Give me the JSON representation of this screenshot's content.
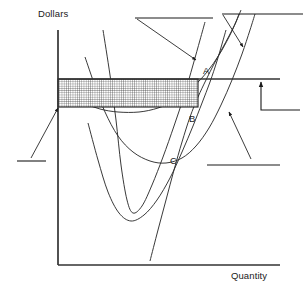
{
  "figure": {
    "kind": "economics-cost-curve-diagram",
    "axes": {
      "y_label": "Dollars",
      "x_label": "Quantity",
      "origin": [
        58,
        265
      ],
      "y_top": [
        58,
        30
      ],
      "x_right": [
        280,
        265
      ],
      "line_color": "#333333"
    },
    "point_labels": [
      {
        "name": "A",
        "text": "A",
        "x": 203,
        "y": 65
      },
      {
        "name": "B",
        "text": "B",
        "x": 189,
        "y": 113
      },
      {
        "name": "C",
        "text": "C",
        "x": 170,
        "y": 155
      }
    ],
    "price_line": {
      "label": "",
      "y": 79,
      "x_start": 58,
      "x_end": 280,
      "color": "#333333"
    },
    "shaded_region": {
      "label": "",
      "x": 58,
      "y": 79,
      "width": 140,
      "height": 28,
      "fill": "cross-hatch",
      "hatch_spacing": 2.2,
      "hatch_color": "#2b2b2b",
      "border_color": "#1a1a1a"
    },
    "callouts": [
      {
        "name": "callout-top-left",
        "text": "",
        "line": {
          "x1": 135,
          "y1": 18,
          "x2": 213,
          "y2": 18
        },
        "leader": {
          "x1": 137,
          "y1": 19,
          "x2": 196,
          "y2": 60
        },
        "arrow": true
      },
      {
        "name": "callout-top-right",
        "text": "",
        "line": {
          "x1": 222,
          "y1": 14,
          "x2": 303,
          "y2": 14
        },
        "leader": {
          "x1": 223,
          "y1": 15,
          "x2": 243,
          "y2": 47
        },
        "arrow": true
      },
      {
        "name": "callout-left",
        "text": "",
        "line": {
          "x1": 17,
          "y1": 161,
          "x2": 46,
          "y2": 161
        },
        "leader": {
          "x1": 31,
          "y1": 158,
          "x2": 58,
          "y2": 108
        },
        "arrow": true
      },
      {
        "name": "callout-bottom-right",
        "text": "",
        "line": {
          "x1": 207,
          "y1": 165,
          "x2": 280,
          "y2": 165
        },
        "leader": {
          "x1": 251,
          "y1": 159,
          "x2": 229,
          "y2": 112
        },
        "arrow": true
      },
      {
        "name": "callout-price-elbow",
        "text": "",
        "elbow": {
          "x": 261,
          "y_bottom": 110,
          "y_top": 82,
          "x_end": 300
        },
        "arrow": true
      }
    ],
    "curves": [
      {
        "name": "marginal-cost-curve",
        "role": "MC",
        "label": "",
        "color": "#2e2e2e",
        "points": [
          [
            103,
            30
          ],
          [
            110,
            75
          ],
          [
            116,
            120
          ],
          [
            121,
            165
          ],
          [
            127,
            200
          ],
          [
            133,
            213
          ],
          [
            142,
            206
          ],
          [
            152,
            185
          ],
          [
            163,
            157
          ],
          [
            174,
            126
          ],
          [
            184,
            96
          ],
          [
            193,
            65
          ],
          [
            200,
            40
          ],
          [
            205,
            22
          ]
        ]
      },
      {
        "name": "average-variable-cost-curve",
        "role": "AVC",
        "label": "",
        "color": "#2e2e2e",
        "points": [
          [
            85,
            57
          ],
          [
            95,
            86
          ],
          [
            105,
            112
          ],
          [
            118,
            136
          ],
          [
            133,
            152
          ],
          [
            150,
            161
          ],
          [
            166,
            163
          ],
          [
            182,
            158
          ],
          [
            196,
            146
          ],
          [
            209,
            128
          ],
          [
            221,
            105
          ],
          [
            232,
            80
          ],
          [
            242,
            54
          ],
          [
            250,
            30
          ],
          [
            255,
            14
          ]
        ]
      },
      {
        "name": "average-total-cost-curve",
        "role": "ATC",
        "label": "",
        "color": "#2e2e2e",
        "points": [
          [
            58,
            83
          ],
          [
            70,
            94
          ],
          [
            84,
            103
          ],
          [
            100,
            109
          ],
          [
            118,
            112
          ],
          [
            139,
            112
          ],
          [
            158,
            108
          ],
          [
            176,
            100
          ],
          [
            193,
            87
          ],
          [
            207,
            72
          ],
          [
            219,
            55
          ],
          [
            229,
            37
          ],
          [
            236,
            22
          ],
          [
            241,
            10
          ]
        ]
      },
      {
        "name": "lower-steep-curve",
        "role": "MC-lower",
        "label": "",
        "color": "#2e2e2e",
        "points": [
          [
            150,
            261
          ],
          [
            158,
            230
          ],
          [
            166,
            200
          ],
          [
            174,
            170
          ],
          [
            182,
            142
          ],
          [
            190,
            117
          ],
          [
            198,
            97
          ],
          [
            206,
            80
          ],
          [
            214,
            64
          ],
          [
            222,
            49
          ],
          [
            229,
            36
          ],
          [
            235,
            24
          ],
          [
            239,
            14
          ]
        ]
      },
      {
        "name": "long-run-curve",
        "role": "LRAC",
        "label": "",
        "color": "#2e2e2e",
        "points": [
          [
            88,
            123
          ],
          [
            98,
            160
          ],
          [
            108,
            192
          ],
          [
            119,
            213
          ],
          [
            131,
            221
          ],
          [
            144,
            215
          ],
          [
            157,
            200
          ],
          [
            170,
            178
          ],
          [
            182,
            152
          ],
          [
            193,
            126
          ],
          [
            202,
            103
          ],
          [
            210,
            82
          ],
          [
            217,
            61
          ],
          [
            222,
            44
          ],
          [
            226,
            30
          ]
        ]
      }
    ]
  }
}
